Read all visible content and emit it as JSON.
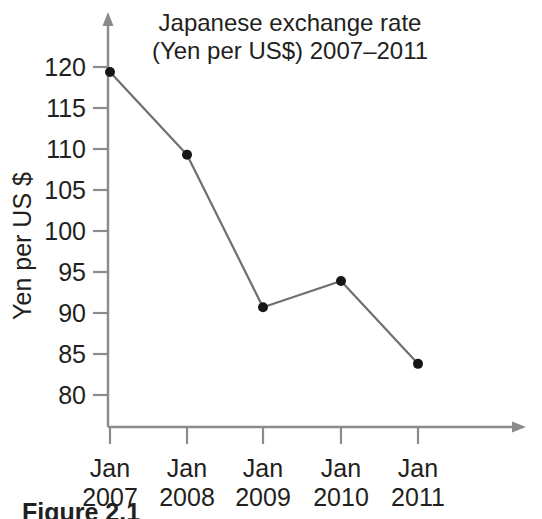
{
  "figure": {
    "caption": "Figure 2.1"
  },
  "chart_data": {
    "type": "line",
    "title": "Japanese exchange rate (Yen per US$) 2007–2011",
    "title_lines": [
      "Japanese exchange rate",
      "(Yen per US$) 2007–2011"
    ],
    "xlabel": "",
    "ylabel": "Yen per US $",
    "categories": [
      "Jan 2007",
      "Jan 2008",
      "Jan 2009",
      "Jan 2010",
      "Jan 2011"
    ],
    "category_lines": [
      [
        "Jan",
        "2007"
      ],
      [
        "Jan",
        "2008"
      ],
      [
        "Jan",
        "2009"
      ],
      [
        "Jan",
        "2010"
      ],
      [
        "Jan",
        "2011"
      ]
    ],
    "values": [
      119.4,
      109.3,
      90.7,
      93.9,
      83.8
    ],
    "series": [
      {
        "name": "Yen per US $",
        "values": [
          119.4,
          109.3,
          90.7,
          93.9,
          83.8
        ]
      }
    ],
    "ytick_labels": [
      "120",
      "115",
      "110",
      "105",
      "100",
      "95",
      "90",
      "85",
      "80"
    ],
    "yticks": [
      120,
      115,
      110,
      105,
      100,
      95,
      90,
      85,
      80
    ],
    "ylim": [
      76,
      123
    ],
    "grid": false,
    "legend": false,
    "marker": "filled-circle",
    "line_color": "#6f6f6f",
    "marker_color": "#161616",
    "axis_color": "#8b8b8b",
    "text_color": "#231f20",
    "background": "#ffffff"
  }
}
